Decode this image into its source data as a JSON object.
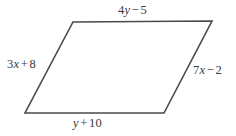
{
  "figure": {
    "type": "parallelogram",
    "stroke_color": "#4a4a4a",
    "fill_color": "#ffffff",
    "text_color": "#3a3a3a",
    "background_color": "#ffffff",
    "stroke_width": 1.6,
    "vertices": {
      "top_left": {
        "x": 73,
        "y": 22
      },
      "top_right": {
        "x": 212,
        "y": 21
      },
      "bottom_right": {
        "x": 164,
        "y": 113
      },
      "bottom_left": {
        "x": 25,
        "y": 113
      }
    },
    "polygon_points": "73,22 212,21 164,113 25,113"
  },
  "labels": {
    "top": {
      "full_text": "4y − 5",
      "coefficient": "4",
      "variable": "y",
      "operator": "−",
      "constant": "5",
      "side": "top"
    },
    "left": {
      "full_text": "3x + 8",
      "coefficient": "3",
      "variable": "x",
      "operator": "+",
      "constant": "8",
      "side": "left"
    },
    "right": {
      "full_text": "7x − 2",
      "coefficient": "7",
      "variable": "x",
      "operator": "−",
      "constant": "2",
      "side": "right"
    },
    "bottom": {
      "full_text": "y + 10",
      "coefficient": "",
      "variable": "y",
      "operator": "+",
      "constant": "10",
      "side": "bottom"
    }
  }
}
